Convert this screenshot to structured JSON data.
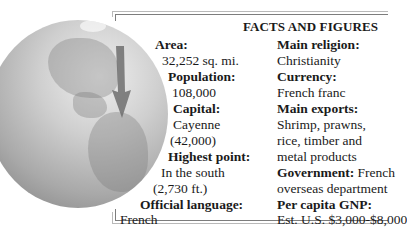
{
  "title": "FACTS AND FIGURES",
  "illustration": {
    "description": "Globe showing the Americas with an arrow pointing to French Guiana",
    "icons": [
      "globe-icon",
      "arrow-down-icon"
    ]
  },
  "left_column": [
    {
      "label": "Area:",
      "value": [
        "32,252 sq. mi."
      ]
    },
    {
      "label": "Population:",
      "value": [
        "108,000"
      ]
    },
    {
      "label": "Capital:",
      "value": [
        "Cayenne",
        "(42,000)"
      ]
    },
    {
      "label": "Highest point:",
      "value": [
        "In the south",
        "(2,730 ft.)"
      ]
    },
    {
      "label": "Official language:",
      "value": [
        "French"
      ]
    }
  ],
  "right_column": [
    {
      "label": "Main religion:",
      "value": [
        "Christianity"
      ]
    },
    {
      "label": "Currency:",
      "value": [
        "French franc"
      ]
    },
    {
      "label": "Main exports:",
      "value": [
        "Shrimp, prawns,",
        "rice, timber and",
        "metal products"
      ]
    },
    {
      "label": "Government:",
      "inline_value": "French",
      "value": [
        "overseas department"
      ]
    },
    {
      "label": "Per capita GNP:",
      "value": [
        "Est. U.S. $3,000-$8,000"
      ]
    }
  ],
  "colors": {
    "text": "#1a1a1a",
    "rule": "#7d7d7d",
    "rule_light": "#b9b9b9",
    "arrow": "#6e6e6e"
  }
}
